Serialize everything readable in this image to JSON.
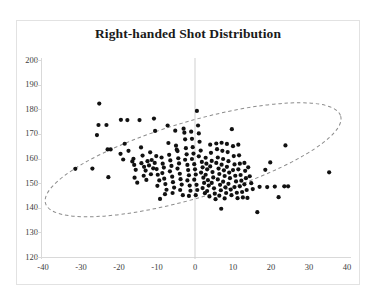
{
  "chart_data": {
    "type": "scatter",
    "title": "Right-handed Shot Distribution",
    "xlabel": "",
    "ylabel": "",
    "xlim": [
      -40,
      40
    ],
    "ylim": [
      120,
      200
    ],
    "xticks": [
      -40,
      -30,
      -20,
      -10,
      0,
      10,
      20,
      30,
      40
    ],
    "yticks": [
      120,
      130,
      140,
      150,
      160,
      170,
      180,
      190,
      200
    ],
    "grid": false,
    "legend": null,
    "marker": {
      "shape": "circle",
      "color": "#111111",
      "size_px": 4.2
    },
    "annotations": [
      {
        "type": "ellipse",
        "style": "dashed",
        "color": "#8c8c8c",
        "center_x": -0.5,
        "center_y": 159.5,
        "semi_major": 40.5,
        "semi_minor": 15.5,
        "rotation_deg": -16.5,
        "note": "dashed gray confidence ellipse enclosing the point cloud"
      },
      {
        "type": "vline",
        "x": 0,
        "color": "#cfcfcf",
        "note": "vertical reference line at x = 0"
      }
    ],
    "points": [
      [
        -31.5,
        155.8
      ],
      [
        -27.0,
        155.9
      ],
      [
        -25.2,
        182.3
      ],
      [
        -25.4,
        173.6
      ],
      [
        -23.3,
        173.6
      ],
      [
        -25.8,
        169.5
      ],
      [
        -23.0,
        163.7
      ],
      [
        -22.2,
        163.7
      ],
      [
        -22.8,
        152.4
      ],
      [
        -19.5,
        175.7
      ],
      [
        -17.8,
        175.6
      ],
      [
        -18.5,
        166.0
      ],
      [
        -19.6,
        161.9
      ],
      [
        -18.9,
        159.6
      ],
      [
        -17.5,
        163.1
      ],
      [
        -16.2,
        159.9
      ],
      [
        -16.5,
        158.8
      ],
      [
        -16.0,
        157.4
      ],
      [
        -15.6,
        155.4
      ],
      [
        -15.9,
        152.2
      ],
      [
        -15.2,
        150.2
      ],
      [
        -14.6,
        175.6
      ],
      [
        -14.2,
        164.5
      ],
      [
        -13.8,
        161.2
      ],
      [
        -14.1,
        158.1
      ],
      [
        -13.4,
        156.6
      ],
      [
        -13.0,
        155.1
      ],
      [
        -13.5,
        153.0
      ],
      [
        -12.8,
        151.3
      ],
      [
        -12.5,
        158.9
      ],
      [
        -12.1,
        157.2
      ],
      [
        -11.8,
        162.5
      ],
      [
        -11.4,
        159.4
      ],
      [
        -11.0,
        156.0
      ],
      [
        -11.6,
        153.6
      ],
      [
        -10.8,
        176.2
      ],
      [
        -10.5,
        171.2
      ],
      [
        -10.2,
        161.0
      ],
      [
        -10.6,
        158.2
      ],
      [
        -10.1,
        155.7
      ],
      [
        -9.8,
        153.4
      ],
      [
        -9.4,
        151.1
      ],
      [
        -9.9,
        148.9
      ],
      [
        -9.2,
        143.6
      ],
      [
        -8.8,
        160.4
      ],
      [
        -8.5,
        157.9
      ],
      [
        -8.2,
        156.3
      ],
      [
        -8.6,
        154.1
      ],
      [
        -8.1,
        151.8
      ],
      [
        -7.8,
        149.6
      ],
      [
        -7.5,
        147.3
      ],
      [
        -7.9,
        145.5
      ],
      [
        -7.2,
        173.4
      ],
      [
        -7.0,
        166.3
      ],
      [
        -6.8,
        161.5
      ],
      [
        -6.5,
        159.2
      ],
      [
        -6.2,
        157.0
      ],
      [
        -6.6,
        154.8
      ],
      [
        -6.0,
        152.6
      ],
      [
        -5.8,
        150.4
      ],
      [
        -5.5,
        148.2
      ],
      [
        -5.9,
        146.0
      ],
      [
        -5.2,
        171.3
      ],
      [
        -5.0,
        165.2
      ],
      [
        -4.8,
        163.6
      ],
      [
        -4.6,
        163.0
      ],
      [
        -4.4,
        160.1
      ],
      [
        -4.2,
        158.0
      ],
      [
        -4.6,
        155.9
      ],
      [
        -4.0,
        153.8
      ],
      [
        -3.8,
        151.6
      ],
      [
        -3.5,
        149.4
      ],
      [
        -3.9,
        147.2
      ],
      [
        -3.2,
        145.1
      ],
      [
        -3.0,
        172.1
      ],
      [
        -2.8,
        170.5
      ],
      [
        -2.6,
        167.8
      ],
      [
        -2.4,
        164.2
      ],
      [
        -2.2,
        161.7
      ],
      [
        -2.6,
        159.5
      ],
      [
        -2.0,
        157.4
      ],
      [
        -1.8,
        155.3
      ],
      [
        -1.6,
        153.2
      ],
      [
        -2.0,
        151.1
      ],
      [
        -1.4,
        149.0
      ],
      [
        -1.2,
        146.9
      ],
      [
        -1.6,
        144.8
      ],
      [
        -1.0,
        170.9
      ],
      [
        -0.8,
        168.0
      ],
      [
        -0.6,
        164.6
      ],
      [
        -0.4,
        162.0
      ],
      [
        -0.8,
        159.8
      ],
      [
        -0.2,
        157.7
      ],
      [
        0.0,
        155.6
      ],
      [
        0.2,
        153.5
      ],
      [
        -0.2,
        151.4
      ],
      [
        0.4,
        149.3
      ],
      [
        0.6,
        147.2
      ],
      [
        0.2,
        145.1
      ],
      [
        0.5,
        179.3
      ],
      [
        0.8,
        173.4
      ],
      [
        1.0,
        170.2
      ],
      [
        1.2,
        166.8
      ],
      [
        1.5,
        163.2
      ],
      [
        1.0,
        160.9
      ],
      [
        1.8,
        158.6
      ],
      [
        2.0,
        156.4
      ],
      [
        1.6,
        154.3
      ],
      [
        2.2,
        152.2
      ],
      [
        2.4,
        150.1
      ],
      [
        2.0,
        148.0
      ],
      [
        2.6,
        145.9
      ],
      [
        2.8,
        160.3
      ],
      [
        3.0,
        157.9
      ],
      [
        3.2,
        155.6
      ],
      [
        2.8,
        153.4
      ],
      [
        3.4,
        151.2
      ],
      [
        3.6,
        149.0
      ],
      [
        3.2,
        146.8
      ],
      [
        3.8,
        144.6
      ],
      [
        4.0,
        165.6
      ],
      [
        4.2,
        162.3
      ],
      [
        4.4,
        159.0
      ],
      [
        4.0,
        156.8
      ],
      [
        4.6,
        154.5
      ],
      [
        4.8,
        152.3
      ],
      [
        4.4,
        150.1
      ],
      [
        5.0,
        147.9
      ],
      [
        5.2,
        145.7
      ],
      [
        5.4,
        143.5
      ],
      [
        5.6,
        166.1
      ],
      [
        5.8,
        163.8
      ],
      [
        6.0,
        160.4
      ],
      [
        5.6,
        158.2
      ],
      [
        6.2,
        155.9
      ],
      [
        6.4,
        153.7
      ],
      [
        6.0,
        151.5
      ],
      [
        6.6,
        149.3
      ],
      [
        6.8,
        147.1
      ],
      [
        6.4,
        144.9
      ],
      [
        6.9,
        139.6
      ],
      [
        7.0,
        166.4
      ],
      [
        7.2,
        163.1
      ],
      [
        7.4,
        159.8
      ],
      [
        7.0,
        157.5
      ],
      [
        7.6,
        155.2
      ],
      [
        7.8,
        152.9
      ],
      [
        7.4,
        150.6
      ],
      [
        8.0,
        148.3
      ],
      [
        8.2,
        146.0
      ],
      [
        7.8,
        143.8
      ],
      [
        8.4,
        165.9
      ],
      [
        8.6,
        162.6
      ],
      [
        8.8,
        158.9
      ],
      [
        8.4,
        156.6
      ],
      [
        9.0,
        154.3
      ],
      [
        9.2,
        152.0
      ],
      [
        8.8,
        149.7
      ],
      [
        9.4,
        147.4
      ],
      [
        9.6,
        145.1
      ],
      [
        9.7,
        171.9
      ],
      [
        10.0,
        165.0
      ],
      [
        10.2,
        161.0
      ],
      [
        10.4,
        157.6
      ],
      [
        10.0,
        155.3
      ],
      [
        10.6,
        153.0
      ],
      [
        10.8,
        150.7
      ],
      [
        10.4,
        148.4
      ],
      [
        11.0,
        146.1
      ],
      [
        11.2,
        143.9
      ],
      [
        11.4,
        165.6
      ],
      [
        11.6,
        161.3
      ],
      [
        11.8,
        157.9
      ],
      [
        11.4,
        155.6
      ],
      [
        12.0,
        153.3
      ],
      [
        12.2,
        151.0
      ],
      [
        11.8,
        148.7
      ],
      [
        12.4,
        146.4
      ],
      [
        12.6,
        144.2
      ],
      [
        13.0,
        158.2
      ],
      [
        13.2,
        155.0
      ],
      [
        13.4,
        152.0
      ],
      [
        13.0,
        149.5
      ],
      [
        13.6,
        147.2
      ],
      [
        13.8,
        144.0
      ],
      [
        14.0,
        156.4
      ],
      [
        14.4,
        152.8
      ],
      [
        14.8,
        150.0
      ],
      [
        15.2,
        147.6
      ],
      [
        16.4,
        138.2
      ],
      [
        17.0,
        148.5
      ],
      [
        18.5,
        155.4
      ],
      [
        19.0,
        148.4
      ],
      [
        19.8,
        158.4
      ],
      [
        21.0,
        148.6
      ],
      [
        22.0,
        144.3
      ],
      [
        23.5,
        148.7
      ],
      [
        24.5,
        148.7
      ],
      [
        23.8,
        165.3
      ],
      [
        35.3,
        154.4
      ]
    ]
  },
  "chart_meta": {
    "point_count_note": "approximately 200 plotted observations",
    "background": "#ffffff",
    "frame_color": "#e2e2e2",
    "axis_color": "#d9d9d9",
    "tick_label_color": "#404040",
    "title_color": "#1a1a1a"
  }
}
